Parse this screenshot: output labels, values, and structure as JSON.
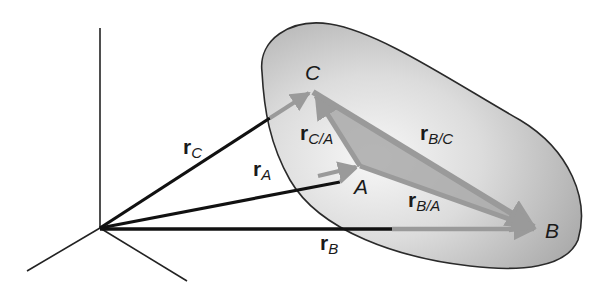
{
  "figure": {
    "colors": {
      "background": "#ffffff",
      "axis": "#222222",
      "absolute_vector": "#111111",
      "relative_vector": "#9a9a9a",
      "body_fill_light": "#f4f4f4",
      "body_fill_dark": "#b9b9b9",
      "body_outline": "#2a2a2a",
      "triangle_fill": "#a9a9a9"
    },
    "points": {
      "C": {
        "label": "C"
      },
      "A": {
        "label": "A"
      },
      "B": {
        "label": "B"
      }
    },
    "vectors": {
      "r_C": {
        "main": "r",
        "sub": "C"
      },
      "r_A": {
        "main": "r",
        "sub": "A"
      },
      "r_B": {
        "main": "r",
        "sub": "B"
      },
      "r_CA": {
        "main": "r",
        "sub": "C/A"
      },
      "r_BC": {
        "main": "r",
        "sub": "B/C"
      },
      "r_BA": {
        "main": "r",
        "sub": "B/A"
      }
    }
  }
}
